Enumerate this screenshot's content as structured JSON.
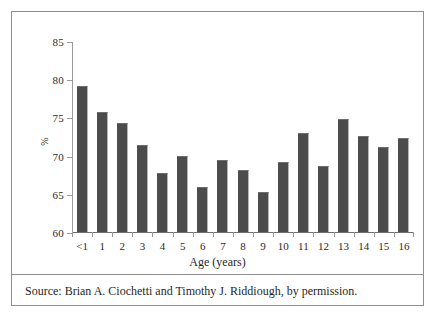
{
  "figure": {
    "source_note": "Source: Brian A. Ciochetti and Timothy J. Riddiough, by permission."
  },
  "chart_data": {
    "type": "bar",
    "title": "",
    "xlabel": "Age (years)",
    "ylabel": "%",
    "categories": [
      "<1",
      "1",
      "2",
      "3",
      "4",
      "5",
      "6",
      "7",
      "8",
      "9",
      "10",
      "11",
      "12",
      "13",
      "14",
      "15",
      "16"
    ],
    "values": [
      79.1,
      75.7,
      74.3,
      71.4,
      67.7,
      69.9,
      65.9,
      69.4,
      68.1,
      65.2,
      69.2,
      72.9,
      68.7,
      74.8,
      72.6,
      71.1,
      72.3
    ],
    "ylim": [
      60,
      85
    ],
    "yticks": [
      60,
      65,
      70,
      75,
      80,
      85
    ],
    "ytick_labels": [
      "60",
      "65",
      "70",
      "75",
      "80",
      "85"
    ],
    "grid": false,
    "legend": false,
    "bar_color": "#4c4c4c",
    "axis_color": "#9a9a9a"
  }
}
